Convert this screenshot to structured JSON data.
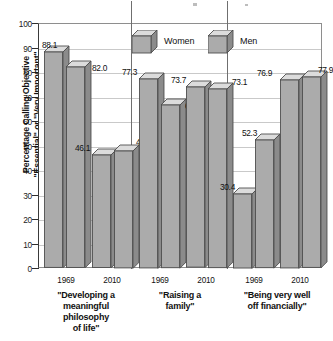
{
  "chart_data": {
    "type": "bar",
    "title": "",
    "subtitle": "",
    "xlabel": "",
    "ylabel": "Percentage Calling Objective \"Essential\" or \"Very Important\"",
    "ylabel_line1": "Percentage Calling Objective",
    "ylabel_line2": "\"Essential\" or \"Very Important\"",
    "ylim": [
      0,
      100
    ],
    "ytick_step": 10,
    "yticks": [
      "100",
      "90",
      "80",
      "70",
      "60",
      "50",
      "40",
      "30",
      "20",
      "10",
      "0"
    ],
    "grid": true,
    "legend_position": "top-center",
    "style": "3d-bar",
    "categories": [
      "1969",
      "2010",
      "1969",
      "2010",
      "1969",
      "2010"
    ],
    "groups": [
      {
        "label": "\"Developing a meaningful philosophy of life\"",
        "label_lines": [
          "\"Developing a",
          "meaningful",
          "philosophy",
          "of life\""
        ],
        "years": [
          "1969",
          "2010"
        ]
      },
      {
        "label": "\"Raising a family\"",
        "label_lines": [
          "\"Raising a",
          "family\""
        ],
        "years": [
          "1969",
          "2010"
        ]
      },
      {
        "label": "\"Being very well off financially\"",
        "label_lines": [
          "\"Being very well",
          "off financially\""
        ],
        "years": [
          "1969",
          "2010"
        ]
      }
    ],
    "series": [
      {
        "name": "Women",
        "values": [
          88.1,
          46.1,
          77.3,
          73.7,
          30.4,
          76.9
        ]
      },
      {
        "name": "Men",
        "values": [
          82.0,
          47.9,
          66.6,
          73.1,
          52.3,
          77.9
        ]
      }
    ],
    "bars": [
      {
        "group": 0,
        "year": "1969",
        "series": "Women",
        "value": 88.1,
        "label": "88.1"
      },
      {
        "group": 0,
        "year": "1969",
        "series": "Men",
        "value": 82.0,
        "label": "82.0"
      },
      {
        "group": 0,
        "year": "2010",
        "series": "Women",
        "value": 46.1,
        "label": "46.1"
      },
      {
        "group": 0,
        "year": "2010",
        "series": "Men",
        "value": 47.9,
        "label": "47.9"
      },
      {
        "group": 1,
        "year": "1969",
        "series": "Women",
        "value": 77.3,
        "label": "77.3"
      },
      {
        "group": 1,
        "year": "1969",
        "series": "Men",
        "value": 66.6,
        "label": "66.6"
      },
      {
        "group": 1,
        "year": "2010",
        "series": "Women",
        "value": 73.7,
        "label": "73.7"
      },
      {
        "group": 1,
        "year": "2010",
        "series": "Men",
        "value": 73.1,
        "label": "73.1"
      },
      {
        "group": 2,
        "year": "1969",
        "series": "Women",
        "value": 30.4,
        "label": "30.4"
      },
      {
        "group": 2,
        "year": "1969",
        "series": "Men",
        "value": 52.3,
        "label": "52.3"
      },
      {
        "group": 2,
        "year": "2010",
        "series": "Women",
        "value": 76.9,
        "label": "76.9"
      },
      {
        "group": 2,
        "year": "2010",
        "series": "Men",
        "value": 77.9,
        "label": "77.9"
      }
    ],
    "legend": [
      {
        "name": "Women",
        "swatch": "cube-3d-gray"
      },
      {
        "name": "Men",
        "swatch": "cube-3d-gray"
      }
    ],
    "colors": {
      "bar_front": "#ababab",
      "bar_top": "#dcdcdc",
      "bar_side": "#8b8b8b",
      "bar_edge": "#4e4e4e",
      "grid": "#c9c9c9",
      "axis": "#2e2e2e",
      "text": "#111111",
      "background": "#ffffff"
    }
  }
}
